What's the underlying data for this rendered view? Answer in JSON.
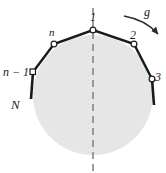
{
  "figure": {
    "type": "physics-diagram",
    "background_color": "#ffffff",
    "cylinder": {
      "name": "cylinder",
      "fill_color": "#e6e6e6",
      "center_x": 93,
      "center_y": 95,
      "radius": 60
    },
    "centerline": {
      "name": "symmetry-axis",
      "style": "dashed",
      "color": "#808080",
      "x": 93,
      "y_top": 8,
      "y_bottom": 172
    },
    "chain": {
      "stroke_color": "#1a1a1a",
      "joint_fill": "#ffffff",
      "nodes": [
        {
          "id": "n-1",
          "label": "n − 1",
          "x": 33,
          "y": 72,
          "label_x": 3,
          "label_y": 66,
          "label_class": "lbl-nm1"
        },
        {
          "id": "n",
          "label": "n",
          "x": 54,
          "y": 44,
          "label_x": 49,
          "label_y": 28,
          "label_class": "lbl-n"
        },
        {
          "id": "1",
          "label": "1",
          "x": 93,
          "y": 30,
          "label_x": 90,
          "label_y": 12,
          "label_class": "lbl-num"
        },
        {
          "id": "2",
          "label": "2",
          "x": 134,
          "y": 44,
          "label_x": 131,
          "label_y": 30,
          "label_class": "lbl-num"
        },
        {
          "id": "3",
          "label": "3",
          "x": 152,
          "y": 79,
          "label_x": 155,
          "label_y": 72,
          "label_class": "lbl-num"
        }
      ],
      "free_end_left": {
        "name": "free-segment-left",
        "x1": 33,
        "y1": 72,
        "x2": 31,
        "y2": 99
      },
      "free_end_right": {
        "name": "free-segment-right",
        "x1": 152,
        "y1": 79,
        "x2": 154,
        "y2": 105
      }
    },
    "labels": {
      "N": {
        "text": "N",
        "x": 11,
        "y": 99,
        "class": "lbl-N"
      },
      "g": {
        "text": "g",
        "x": 144,
        "y": 7,
        "class": "lbl-g"
      }
    },
    "gravity_arrow": {
      "name": "gravity-arrow",
      "label": "g",
      "path": "M 124,16 Q 146,20 159,35",
      "color": "#2b2b2b",
      "direction": "clockwise-down-right"
    }
  }
}
